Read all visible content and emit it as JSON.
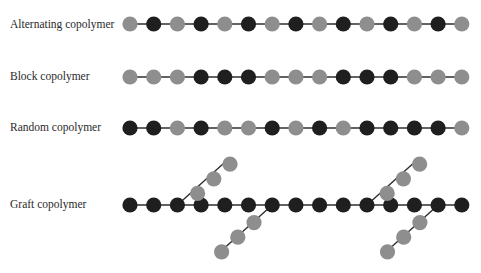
{
  "colors": {
    "monomer_a": "#8e8e8e",
    "monomer_b": "#1f1f1f",
    "bond": "#2e2e2e"
  },
  "legend": {
    "A": "gray monomer",
    "B": "black monomer"
  },
  "rows": [
    {
      "id": "alternating",
      "label": "Alternating copolymer",
      "sequence": [
        "A",
        "B",
        "A",
        "B",
        "A",
        "B",
        "A",
        "B",
        "A",
        "B",
        "A",
        "B",
        "A",
        "B",
        "A"
      ]
    },
    {
      "id": "block",
      "label": "Block copolymer",
      "sequence": [
        "A",
        "A",
        "A",
        "B",
        "B",
        "B",
        "A",
        "A",
        "A",
        "B",
        "B",
        "B",
        "A",
        "A",
        "A"
      ]
    },
    {
      "id": "random",
      "label": "Random copolymer",
      "sequence": [
        "B",
        "B",
        "A",
        "B",
        "A",
        "A",
        "B",
        "A",
        "B",
        "A",
        "B",
        "B",
        "B",
        "B",
        "A"
      ]
    },
    {
      "id": "graft",
      "label": "Graft copolymer",
      "sequence": [
        "B",
        "B",
        "B",
        "B",
        "B",
        "B",
        "B",
        "B",
        "B",
        "B",
        "B",
        "B",
        "B",
        "B",
        "B"
      ],
      "branches": [
        {
          "attach_index": 2,
          "direction": "up",
          "sequence": [
            "A",
            "A",
            "A"
          ]
        },
        {
          "attach_index": 6,
          "direction": "down",
          "sequence": [
            "A",
            "A",
            "A"
          ]
        },
        {
          "attach_index": 10,
          "direction": "up",
          "sequence": [
            "A",
            "A",
            "A"
          ]
        },
        {
          "attach_index": 13,
          "direction": "down",
          "sequence": [
            "A",
            "A",
            "A"
          ]
        }
      ]
    }
  ]
}
